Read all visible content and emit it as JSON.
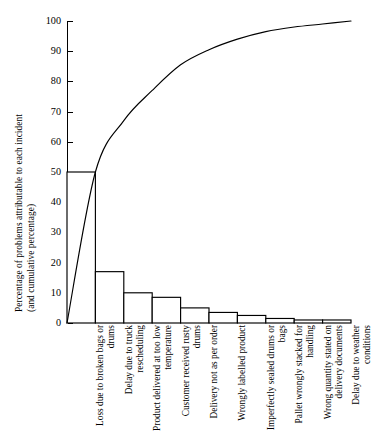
{
  "chart_data": {
    "type": "bar",
    "title": "",
    "subtitle": "",
    "xlabel": "",
    "ylabel": "Percentage of problems attributable to each incident (and cumulative percentage)",
    "ylabel_line1": "Percentage of problems attributable to each incident",
    "ylabel_line2": "(and cumulative percentage)",
    "ylim": [
      0,
      100
    ],
    "yticks": [
      0,
      10,
      20,
      30,
      40,
      50,
      60,
      70,
      80,
      90,
      100
    ],
    "ytick_labels": [
      "0",
      "10",
      "20",
      "30",
      "40",
      "50",
      "60",
      "70",
      "80",
      "90",
      "100"
    ],
    "grid": false,
    "legend": "none",
    "categories": [
      "Loss due to broken bags or drums",
      "Delay due to truck rescheduling",
      "Product delivered at too low temperature",
      "Customer received rusty drums",
      "Delivery not as per order",
      "Wrongly labelled product",
      "Imperfectly sealed drums or bags",
      "Pallet wrongly stacked for handling",
      "Wrong quantity stated on delivery documents",
      "Delay due to weather conditions"
    ],
    "values": [
      50,
      17,
      10,
      8.5,
      5,
      3.5,
      2.5,
      1.5,
      1,
      1
    ],
    "series": [
      {
        "name": "Percentage of problems attributable to each incident",
        "type": "bar",
        "values": [
          50,
          17,
          10,
          8.5,
          5,
          3.5,
          2.5,
          1.5,
          1,
          1
        ]
      },
      {
        "name": "Cumulative percentage",
        "type": "line",
        "values": [
          50,
          67,
          77,
          85.5,
          90.5,
          94,
          96.5,
          98,
          99,
          100
        ]
      }
    ],
    "cumulative_start": 0,
    "bar_color": "#ffffff",
    "bar_edge_color": "#000000",
    "line_color": "#000000"
  }
}
